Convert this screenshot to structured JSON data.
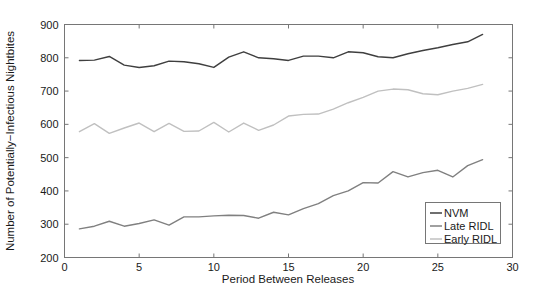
{
  "chart_data": {
    "type": "line",
    "title": "",
    "xlabel": "Period Between Releases",
    "ylabel": "Number of Potentially−Infectious Nightbites",
    "xlim": [
      0,
      30
    ],
    "ylim": [
      200,
      900
    ],
    "xticks": [
      0,
      5,
      10,
      15,
      20,
      25,
      30
    ],
    "xtick_labels": [
      "0",
      "5",
      "10",
      "15",
      "20",
      "25",
      "30"
    ],
    "yticks": [
      200,
      300,
      400,
      500,
      600,
      700,
      800,
      900
    ],
    "ytick_labels": [
      "200",
      "300",
      "400",
      "500",
      "600",
      "700",
      "800",
      "900"
    ],
    "grid": false,
    "legend_position": "lower right",
    "x": [
      1,
      2,
      3,
      4,
      5,
      6,
      7,
      8,
      9,
      10,
      11,
      12,
      13,
      14,
      15,
      16,
      17,
      18,
      19,
      20,
      21,
      22,
      23,
      24,
      25,
      26,
      27,
      28
    ],
    "series": [
      {
        "name": "NVM",
        "color": "#3f3f3f",
        "values": [
          792,
          793,
          804,
          778,
          771,
          776,
          790,
          788,
          782,
          771,
          802,
          818,
          800,
          797,
          792,
          805,
          805,
          800,
          818,
          815,
          803,
          800,
          812,
          822,
          830,
          840,
          848,
          870
        ]
      },
      {
        "name": "Late RIDL",
        "color": "#808080",
        "values": [
          286,
          294,
          309,
          294,
          302,
          313,
          297,
          322,
          322,
          325,
          327,
          326,
          318,
          336,
          328,
          347,
          362,
          386,
          400,
          425,
          424,
          458,
          442,
          455,
          462,
          442,
          476,
          494
        ]
      },
      {
        "name": "Early RIDL",
        "color": "#c0c0c0",
        "values": [
          578,
          602,
          573,
          589,
          604,
          578,
          603,
          579,
          580,
          606,
          577,
          604,
          582,
          598,
          625,
          630,
          631,
          646,
          665,
          681,
          700,
          706,
          704,
          692,
          689,
          700,
          708,
          720
        ]
      }
    ]
  },
  "legend": {
    "entries": [
      {
        "label": "NVM"
      },
      {
        "label": "Late RIDL"
      },
      {
        "label": "Early RIDL"
      }
    ]
  }
}
